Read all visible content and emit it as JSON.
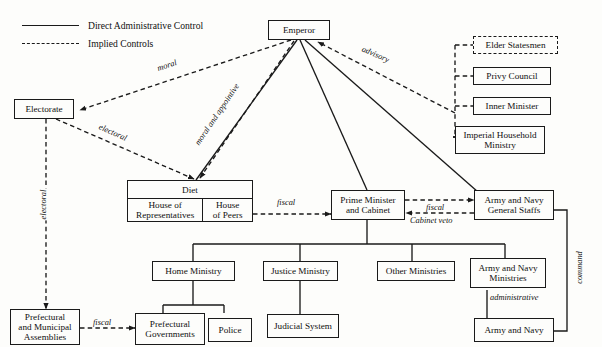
{
  "diagram": {
    "legend": {
      "items": [
        {
          "label": "Direct Administrative Control",
          "style": "solid"
        },
        {
          "label": "Implied Controls",
          "style": "dashed"
        }
      ]
    },
    "nodes": {
      "emperor": "Emperor",
      "electorate": "Electorate",
      "elder_statesmen": "Elder Statesmen",
      "privy_council": "Privy Council",
      "inner_minister": "Inner Minister",
      "imperial_household_ministry": "Imperial Household\nMinistry",
      "diet": "Diet",
      "house_of_representatives": "House of\nRepresentatives",
      "house_of_peers": "House\nof Peers",
      "prime_minister_and_cabinet": "Prime Minister\nand Cabinet",
      "army_navy_general_staffs": "Army and Navy\nGeneral Staffs",
      "home_ministry": "Home Ministry",
      "justice_ministry": "Justice Ministry",
      "other_ministries": "Other Ministries",
      "army_navy_ministries": "Army and Navy\nMinistries",
      "prefectural_and_municipal_assemblies": "Prefectural\nand Municipal\nAssemblies",
      "prefectural_governments": "Prefectural\nGovernments",
      "police": "Police",
      "judicial_system": "Judicial System",
      "army_and_navy": "Army and Navy"
    },
    "edge_labels": {
      "moral": "moral",
      "advisory": "advisory",
      "electoral_diagonal": "electoral",
      "electoral_vertical": "electoral",
      "moral_and_appointive": "moral and appointive",
      "fiscal_diet": "fiscal",
      "fiscal_staffs": "fiscal",
      "cabinet_veto": "Cabinet veto",
      "fiscal_prefectural": "fiscal",
      "administrative": "administrative",
      "command": "command"
    },
    "colors": {
      "ink": "#1a1a1a",
      "paper": "#fdfdfb"
    }
  }
}
